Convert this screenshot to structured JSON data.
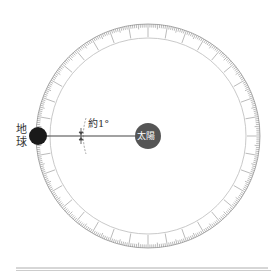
{
  "diagram": {
    "earth_label": "地球",
    "earth_label_line1": "地",
    "earth_label_line2": "球",
    "sun_label": "太陽",
    "angle_label": "約1°",
    "colors": {
      "earth": "#1a1a1a",
      "sun": "#555555",
      "ring": "#888888",
      "line": "#444444"
    },
    "center": [
      148,
      136
    ],
    "outer_radius": 112,
    "inner_radius": 98
  }
}
